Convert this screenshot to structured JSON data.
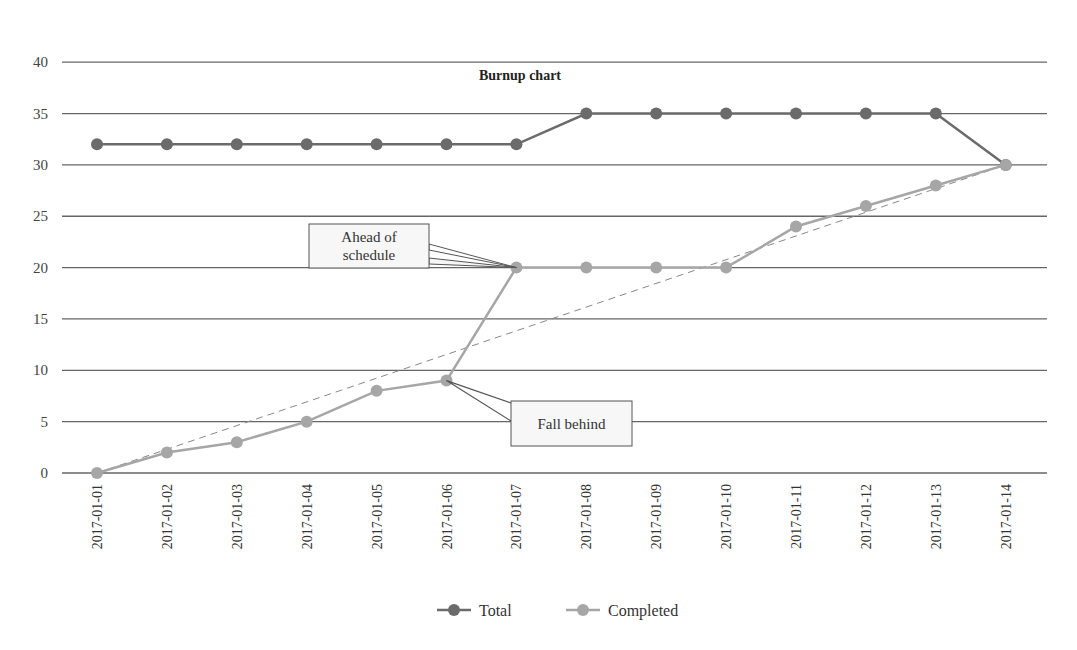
{
  "chart_data": {
    "type": "line",
    "title": "Burnup chart",
    "xlabel": "",
    "ylabel": "",
    "ylim": [
      0,
      40
    ],
    "yticks": [
      0,
      5,
      10,
      15,
      20,
      25,
      30,
      35,
      40
    ],
    "grid": true,
    "legend_position": "bottom",
    "categories": [
      "2017-01-01",
      "2017-01-02",
      "2017-01-03",
      "2017-01-04",
      "2017-01-05",
      "2017-01-06",
      "2017-01-07",
      "2017-01-08",
      "2017-01-09",
      "2017-01-10",
      "2017-01-11",
      "2017-01-12",
      "2017-01-13",
      "2017-01-14"
    ],
    "series": [
      {
        "name": "Total",
        "color": "#6b6b6b",
        "values": [
          32,
          32,
          32,
          32,
          32,
          32,
          32,
          35,
          35,
          35,
          35,
          35,
          35,
          30
        ]
      },
      {
        "name": "Completed",
        "color": "#a6a6a6",
        "values": [
          0,
          2,
          3,
          5,
          8,
          9,
          20,
          20,
          20,
          20,
          24,
          26,
          28,
          30
        ]
      }
    ],
    "ideal_line": {
      "style": "dashed",
      "color": "#888888",
      "from": [
        0,
        0
      ],
      "to": [
        13,
        30
      ]
    },
    "annotations": [
      {
        "text_lines": [
          "Ahead of",
          "schedule"
        ],
        "points_to": "2017-01-07",
        "value": 20
      },
      {
        "text_lines": [
          "Fall behind"
        ],
        "points_to": "2017-01-06",
        "value": 9
      }
    ]
  }
}
